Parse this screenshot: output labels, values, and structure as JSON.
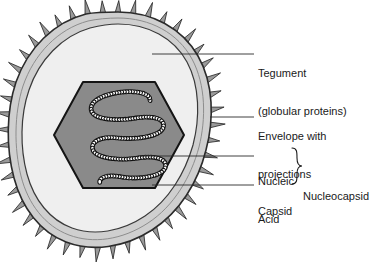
{
  "figure": {
    "background_color": "#ffffff",
    "ink_color": "#1a1a1a"
  },
  "labels": {
    "tegument": {
      "line1": "Tegument",
      "line2": "(globular proteins)"
    },
    "envelope": {
      "line1": "Envelope with",
      "line2": "projections"
    },
    "nucleic_acid": {
      "line1": "Nucleic",
      "line2": "Acid"
    },
    "capsid": {
      "line1": "Capsid"
    },
    "nucleocapsid": {
      "line1": "Nucleocapsid"
    },
    "brace": "}"
  },
  "structures": {
    "envelope": {
      "name": "Envelope with projections",
      "fill_color": "#cfcfcf",
      "stroke_color": "#2b2b2b",
      "spike_count": 46,
      "spike_fill": "#9a9a9a"
    },
    "tegument": {
      "name": "Tegument (globular proteins)",
      "fill_color": "#efefef",
      "stroke_color": "#3a3a3a"
    },
    "capsid": {
      "name": "Capsid",
      "shape": "hexagon",
      "fill_color": "#8a8a8a",
      "stroke_color": "#1a1a1a"
    },
    "nucleic_acid": {
      "name": "Nucleic Acid",
      "shape": "coiled beaded strand",
      "fill_color": "#ffffff",
      "stroke_color": "#111111",
      "coil_loops": 4
    }
  },
  "leader_lines": [
    {
      "name": "tegument-leader",
      "from_x": 152,
      "from_y": 54,
      "to_x": 254,
      "to_y": 54
    },
    {
      "name": "envelope-leader",
      "from_x": 210,
      "from_y": 117,
      "to_x": 254,
      "to_y": 117
    },
    {
      "name": "nucleic-acid-leader",
      "from_x": 140,
      "from_y": 156,
      "to_x": 254,
      "to_y": 156
    },
    {
      "name": "capsid-leader",
      "from_x": 152,
      "from_y": 185,
      "to_x": 254,
      "to_y": 185
    }
  ]
}
